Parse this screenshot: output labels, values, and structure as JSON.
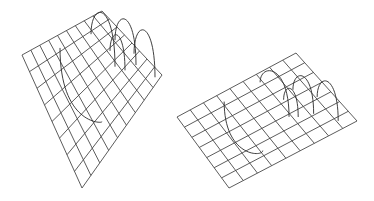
{
  "figure": {
    "background": "#ffffff",
    "line_color": "#4a4a4a",
    "panels": [
      {
        "name": "left-surface",
        "corners": {
          "top": [
            102,
            11
          ],
          "right": [
            162,
            75
          ],
          "bottom": [
            82,
            188
          ],
          "left": [
            22,
            55
          ]
        },
        "cells_u": 8,
        "cells_v": 9,
        "curves": [
          {
            "type": "arch",
            "from": [
              0.15,
              0.25
            ],
            "to": [
              0.55,
              0.25
            ],
            "height": 38
          },
          {
            "type": "arch",
            "from": [
              0.35,
              0.1
            ],
            "to": [
              0.7,
              0.1
            ],
            "height": 34
          },
          {
            "type": "arch",
            "from": [
              0.4,
              0.2
            ],
            "to": [
              0.65,
              0.2
            ],
            "height": 26
          },
          {
            "type": "arch",
            "from": [
              0.6,
              0.05
            ],
            "to": [
              0.95,
              0.05
            ],
            "height": 36
          },
          {
            "type": "valley",
            "from": [
              0.1,
              0.6
            ],
            "to": [
              0.8,
              0.6
            ],
            "depth": 30
          }
        ]
      },
      {
        "name": "right-surface",
        "corners": {
          "top": [
            296,
            53
          ],
          "right": [
            357,
            121
          ],
          "bottom": [
            229,
            188
          ],
          "left": [
            177,
            117
          ]
        },
        "cells_u": 7,
        "cells_v": 9,
        "curves": [
          {
            "type": "arch",
            "from": [
              0.1,
              0.35
            ],
            "to": [
              0.6,
              0.35
            ],
            "height": 28
          },
          {
            "type": "arch",
            "from": [
              0.35,
              0.2
            ],
            "to": [
              0.7,
              0.2
            ],
            "height": 26
          },
          {
            "type": "arch",
            "from": [
              0.4,
              0.3
            ],
            "to": [
              0.65,
              0.3
            ],
            "height": 20
          },
          {
            "type": "arch",
            "from": [
              0.55,
              0.1
            ],
            "to": [
              0.9,
              0.1
            ],
            "height": 28
          },
          {
            "type": "valley",
            "from": [
              0.1,
              0.65
            ],
            "to": [
              0.8,
              0.65
            ],
            "depth": 24
          }
        ]
      }
    ]
  }
}
